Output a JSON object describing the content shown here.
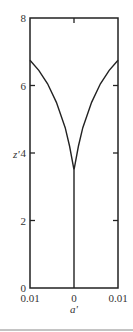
{
  "chart_data": {
    "type": "line",
    "title": "",
    "xlabel": "a'",
    "ylabel": "z'",
    "xlim": [
      -0.01,
      0.01
    ],
    "ylim": [
      0,
      8
    ],
    "x_tick_labels": [
      "0.01",
      "0",
      "0.01"
    ],
    "y_tick_labels": [
      "0",
      "2",
      "4",
      "6",
      "8"
    ],
    "grid": false,
    "legend": null,
    "series": [
      {
        "name": "profile",
        "x": [
          -0.01,
          -0.008,
          -0.006,
          -0.004,
          -0.002,
          -0.001,
          0.0,
          0.001,
          0.002,
          0.004,
          0.006,
          0.008,
          0.01
        ],
        "y": [
          6.75,
          6.45,
          6.05,
          5.5,
          4.75,
          4.2,
          3.5,
          4.2,
          4.75,
          5.5,
          6.05,
          6.45,
          6.75
        ]
      },
      {
        "name": "axis-line",
        "x": [
          0,
          0
        ],
        "y": [
          0,
          3.5
        ]
      }
    ]
  }
}
